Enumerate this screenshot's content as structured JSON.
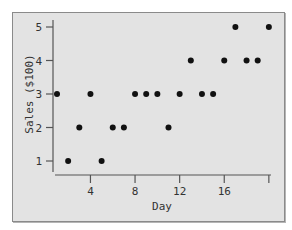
{
  "chart_data": {
    "type": "scatter",
    "title": "",
    "xlabel": "Day",
    "ylabel": "Sales ($100)",
    "x": [
      1,
      2,
      3,
      4,
      5,
      6,
      7,
      8,
      9,
      10,
      11,
      12,
      13,
      14,
      15,
      16,
      17,
      18,
      19,
      20
    ],
    "y": [
      3,
      1,
      2,
      3,
      1,
      2,
      2,
      3,
      3,
      3,
      2,
      3,
      4,
      3,
      3,
      4,
      5,
      4,
      4,
      5
    ],
    "xlim": [
      1,
      20
    ],
    "ylim": [
      1,
      5
    ],
    "xticks": [
      4,
      8,
      12,
      16,
      20
    ],
    "xtick_labels": [
      "4",
      "8",
      "12",
      "16",
      ""
    ],
    "yticks": [
      1,
      2,
      3,
      4,
      5
    ],
    "ytick_labels": [
      "1",
      "2",
      "3",
      "4",
      "5"
    ],
    "grid": false,
    "legend": null,
    "colors": {
      "marker": "#111111",
      "axis": "#555555",
      "background": "#e3e3e3",
      "frame": "#8a8a8a"
    }
  }
}
